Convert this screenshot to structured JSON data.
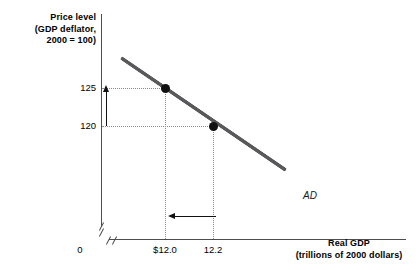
{
  "chart_data": {
    "type": "line",
    "title": "",
    "subtitle": "",
    "xlabel": "Real GDP",
    "xlabel_sub": "(trillions of 2000 dollars)",
    "ylabel": "Price level",
    "ylabel_sub_1": "(GDP deflator,",
    "ylabel_sub_2": "2000 = 100)",
    "grid": "dotted-guides-only",
    "legend": "inline-curve-label",
    "series": [
      {
        "name": "AD",
        "label": "AD",
        "color": "#59595b",
        "x": [
          12.0,
          12.2
        ],
        "y": [
          125,
          120
        ],
        "points": [
          {
            "x": 12.0,
            "y": 125,
            "x_tick_label": "$12.0",
            "y_tick_label": "125"
          },
          {
            "x": 12.2,
            "y": 120,
            "x_tick_label": "12.2",
            "y_tick_label": "120"
          }
        ]
      }
    ],
    "x_ticks": [
      "0",
      "$12.0",
      "12.2"
    ],
    "y_ticks": [
      "125",
      "120"
    ],
    "annotations": [
      {
        "name": "price-level-increase-arrow",
        "direction": "up",
        "from_y": 120,
        "to_y": 125
      },
      {
        "name": "real-gdp-decrease-arrow",
        "direction": "left",
        "from_x": 12.2,
        "to_x": 12.0
      }
    ],
    "axis_breaks": {
      "x": true,
      "y": true
    },
    "origin_label": "0"
  },
  "axes": {
    "y_title": {
      "line1": "Price level",
      "line2": "(GDP deflator,",
      "line3": "2000 = 100)"
    },
    "x_title": {
      "line1": "Real GDP",
      "line2": "(trillions of 2000 dollars)"
    },
    "y_ticks": {
      "upper": "125",
      "lower": "120"
    },
    "x_ticks": {
      "origin": "0",
      "first": "$12.0",
      "second": "12.2"
    }
  },
  "curve": {
    "label": "AD"
  },
  "colors": {
    "curve": "#59595b",
    "axis": "#4d4d4d",
    "guide": "#8a8a8a",
    "point": "#111111",
    "text": "#000000",
    "background": "#ffffff"
  }
}
